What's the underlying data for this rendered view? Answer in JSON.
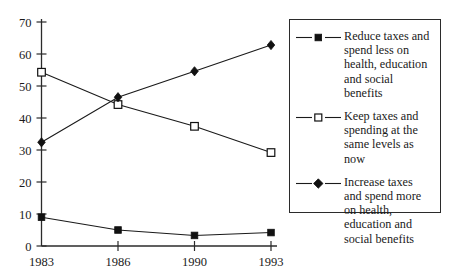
{
  "chart_data": {
    "type": "line",
    "title": "",
    "subtitle": "",
    "xlabel": "",
    "ylabel": "",
    "categories": [
      "1983",
      "1986",
      "1990",
      "1993"
    ],
    "x_tick_labels": [
      "1983",
      "1986",
      "1990",
      "1993"
    ],
    "y_tick_labels": [
      "0",
      "10",
      "20",
      "30",
      "40",
      "50",
      "60",
      "70"
    ],
    "y_ticks": [
      0,
      10,
      20,
      30,
      40,
      50,
      60,
      70
    ],
    "ylim": [
      0,
      70
    ],
    "grid": false,
    "legend_position": "right",
    "series": [
      {
        "name": "Reduce taxes and spend less on health, education and social benefits",
        "marker": "filled-square",
        "values": [
          9,
          5,
          3.3,
          4.2
        ]
      },
      {
        "name": "Keep taxes and spending at the same levels as now",
        "marker": "open-square",
        "values": [
          54.3,
          44.2,
          37.4,
          29.2
        ]
      },
      {
        "name": "Increase taxes and spend more on health, education and social benefits",
        "marker": "filled-diamond",
        "values": [
          32.4,
          46.5,
          54.6,
          62.8
        ]
      }
    ]
  },
  "legend": {
    "entries": [
      {
        "marker_name": "filled-square-marker",
        "label": "Reduce taxes and\nspend less on\nhealth, education\nand social\nbenefits"
      },
      {
        "marker_name": "open-square-marker",
        "label": "Keep taxes and\nspending at the\nsame levels as\nnow"
      },
      {
        "marker_name": "filled-diamond-marker",
        "label": "Increase taxes\nand spend more\non health,\neducation and\nsocial benefits"
      }
    ]
  },
  "axes": {
    "y_labels": [
      "70",
      "60",
      "50",
      "40",
      "30",
      "20",
      "10",
      "0"
    ],
    "x_labels": [
      "1983",
      "1986",
      "1990",
      "1993"
    ]
  },
  "colors": {
    "ink": "#1a1a1a",
    "axis": "#2b2b2b",
    "marker_fill": "#111111",
    "background": "#ffffff"
  }
}
